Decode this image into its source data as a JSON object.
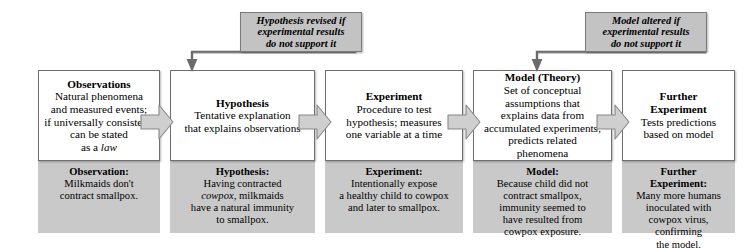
{
  "diagram": {
    "colors": {
      "example_box_fill": "#c9c9c9",
      "loop_box_fill": "#c3c3c3",
      "arrow_fill": "#cfcfcf",
      "box_border": "#6f6f6f",
      "line": "#6a6a6a",
      "text": "#000000"
    },
    "stages": [
      {
        "definition": {
          "title": "Observations",
          "lines": [
            "Natural phenomena",
            "and measured events;",
            "if universally consistent,",
            "can be stated"
          ],
          "last_line_prefix": "as a ",
          "last_line_italic": "law"
        },
        "example": {
          "title": "Observation:",
          "lines": [
            "Milkmaids don't",
            "contract smallpox."
          ]
        }
      },
      {
        "definition": {
          "title": "Hypothesis",
          "lines": [
            "Tentative explanation",
            "that explains observations"
          ],
          "last_line_prefix": "",
          "last_line_italic": ""
        },
        "example": {
          "title": "Hypothesis:",
          "lines": [
            "Having contracted",
            "cowpox, milkmaids",
            "have a natural immunity",
            "to smallpox."
          ],
          "italic_word": "cowpox"
        }
      },
      {
        "definition": {
          "title": "Experiment",
          "lines": [
            "Procedure to test",
            "hypothesis; measures",
            "one variable at a time"
          ],
          "last_line_prefix": "",
          "last_line_italic": ""
        },
        "example": {
          "title": "Experiment:",
          "lines": [
            "Intentionally expose",
            "a healthy child to cowpox",
            "and later to smallpox."
          ]
        }
      },
      {
        "definition": {
          "title": "Model (Theory)",
          "lines": [
            "Set of conceptual",
            "assumptions that",
            "explains data from",
            "accumulated experiments;",
            "predicts related",
            "phenomena"
          ],
          "last_line_prefix": "",
          "last_line_italic": ""
        },
        "example": {
          "title": "Model:",
          "lines": [
            "Because child did not",
            "contract smallpox,",
            "immunity seemed to",
            "have resulted from",
            "cowpox exposure."
          ]
        }
      },
      {
        "definition": {
          "title": "Further",
          "title2": "Experiment",
          "lines": [
            "Tests predictions",
            "based on model"
          ],
          "last_line_prefix": "",
          "last_line_italic": ""
        },
        "example": {
          "title": "Further",
          "title2": "Experiment:",
          "lines": [
            "Many more humans",
            "inoculated with",
            "cowpox virus, confirming",
            "the model."
          ]
        }
      }
    ],
    "feedback_loops": [
      {
        "lines": [
          "Hypothesis revised if",
          "experimental results",
          "do not support it"
        ],
        "from_stage": "Experiment",
        "to_stage": "Hypothesis"
      },
      {
        "lines": [
          "Model altered if",
          "experimental results",
          "do not support it"
        ],
        "from_stage": "Further Experiment",
        "to_stage": "Model (Theory)"
      }
    ]
  }
}
